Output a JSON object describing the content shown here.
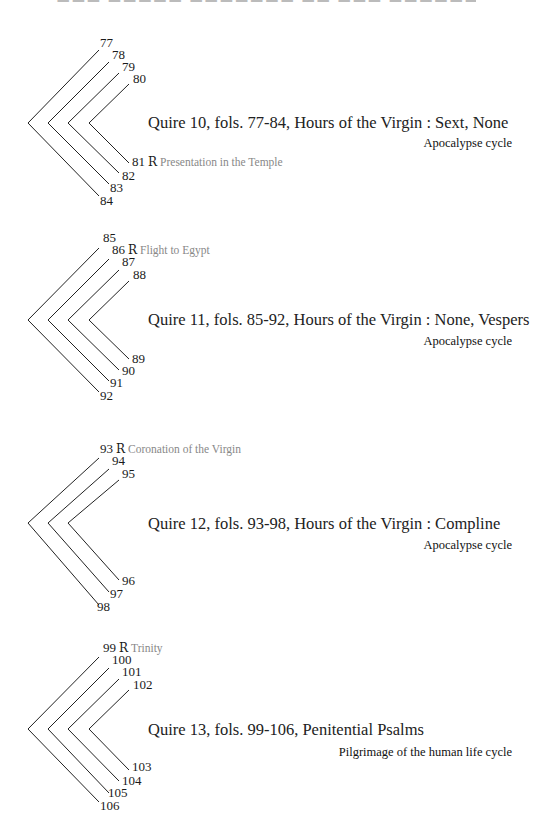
{
  "quires": [
    {
      "title": "Quire 10, fols. 77-84, Hours of the Virgin : Sext, None",
      "cycle": "Apocalypse cycle",
      "leaves": [
        {
          "folio": "77"
        },
        {
          "folio": "78"
        },
        {
          "folio": "79"
        },
        {
          "folio": "80"
        },
        {
          "folio": "81",
          "recto": "R",
          "subject": "Presentation in the Temple"
        },
        {
          "folio": "82"
        },
        {
          "folio": "83"
        },
        {
          "folio": "84"
        }
      ]
    },
    {
      "title": "Quire 11, fols. 85-92, Hours of the Virgin : None, Vespers",
      "cycle": "Apocalypse cycle",
      "leaves": [
        {
          "folio": "85"
        },
        {
          "folio": "86",
          "recto": "R",
          "subject": "Flight to Egypt"
        },
        {
          "folio": "87"
        },
        {
          "folio": "88"
        },
        {
          "folio": "89"
        },
        {
          "folio": "90"
        },
        {
          "folio": "91"
        },
        {
          "folio": "92"
        }
      ]
    },
    {
      "title": "Quire 12, fols. 93-98, Hours of the Virgin : Compline",
      "cycle": "Apocalypse cycle",
      "leaves": [
        {
          "folio": "93",
          "recto": "R",
          "subject": "Coronation of the Virgin"
        },
        {
          "folio": "94"
        },
        {
          "folio": "95"
        },
        {
          "folio": "96"
        },
        {
          "folio": "97"
        },
        {
          "folio": "98"
        }
      ]
    },
    {
      "title": "Quire 13, fols. 99-106, Penitential Psalms",
      "cycle": "Pilgrimage of the human life cycle",
      "leaves": [
        {
          "folio": "99",
          "recto": "R",
          "subject": "Trinity"
        },
        {
          "folio": "100"
        },
        {
          "folio": "101"
        },
        {
          "folio": "102"
        },
        {
          "folio": "103"
        },
        {
          "folio": "104"
        },
        {
          "folio": "105"
        },
        {
          "folio": "106"
        }
      ]
    }
  ]
}
